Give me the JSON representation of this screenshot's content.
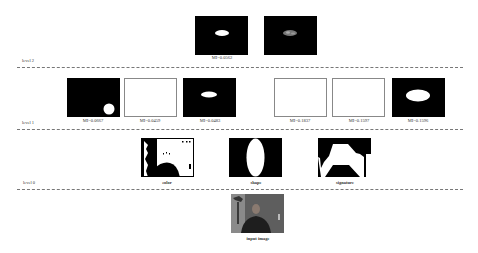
{
  "levels": [
    {
      "label": "level 2"
    },
    {
      "label": "level 1"
    },
    {
      "label": "level 0"
    }
  ],
  "level2": {
    "images": [
      {
        "name": "level2-fused-mask",
        "style": "black",
        "content": "small white horizontal ellipse centered"
      },
      {
        "name": "level2-masked-face",
        "style": "black",
        "content": "small gray textured ellipse centered"
      }
    ],
    "caption": "MI=0.0562"
  },
  "level1": {
    "images": [
      {
        "name": "color-shape",
        "style": "black",
        "content": "white circle bottom right",
        "caption": "MI=0.0667"
      },
      {
        "name": "color-signature",
        "style": "white",
        "content": "blank",
        "caption": "MI=0.0459"
      },
      {
        "name": "shape-signature",
        "style": "black",
        "content": "white horizontal ellipse upper center",
        "caption": "MI=0.0483"
      },
      {
        "name": "shape-color",
        "style": "white",
        "content": "blank",
        "caption": "MI=0.1837"
      },
      {
        "name": "signature-color",
        "style": "white",
        "content": "blank",
        "caption": "MI=0.1597"
      },
      {
        "name": "signature-shape",
        "style": "black",
        "content": "large white ellipse center",
        "caption": "MI=0.1596"
      }
    ]
  },
  "level0": {
    "images": [
      {
        "name": "color",
        "caption": "color"
      },
      {
        "name": "shape",
        "caption": "shape"
      },
      {
        "name": "signature",
        "caption": "signature"
      }
    ]
  },
  "input": {
    "caption": "input image"
  },
  "colors": {
    "mask_bg": "#000000",
    "mask_fg": "#ffffff",
    "dash": "#777777",
    "photo_bg": "#6b6b6b"
  }
}
